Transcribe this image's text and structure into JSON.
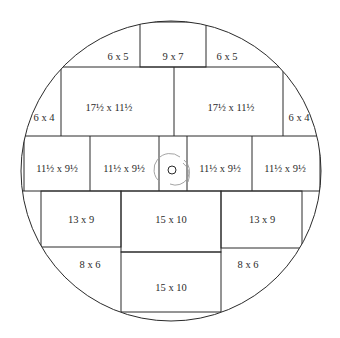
{
  "diagram": {
    "title": "",
    "pieces": [
      {
        "id": "top-left-6x5",
        "label": "6 x 5"
      },
      {
        "id": "top-center-9x7",
        "label": "9 x 7"
      },
      {
        "id": "top-right-6x5",
        "label": "6 x 5"
      },
      {
        "id": "left-6x4",
        "label": "6 x 4"
      },
      {
        "id": "upper-left-17x11",
        "label": "17½ x  11½"
      },
      {
        "id": "upper-right-17x11",
        "label": "17½ x 11½"
      },
      {
        "id": "right-6x4",
        "label": "6 x 4"
      },
      {
        "id": "middle-1-11x9",
        "label": "11½ x 9½"
      },
      {
        "id": "middle-2-11x9",
        "label": "11½ x 9½"
      },
      {
        "id": "middle-3-11x9",
        "label": "11½ x 9½"
      },
      {
        "id": "middle-4-11x9",
        "label": "11½ x 9½"
      },
      {
        "id": "lower-left-13x9",
        "label": "13 x 9"
      },
      {
        "id": "lower-center-15x10",
        "label": "15 x 10"
      },
      {
        "id": "lower-right-13x9",
        "label": "13 x 9"
      },
      {
        "id": "bottom-left-8x6",
        "label": "8 x 6"
      },
      {
        "id": "bottom-center-15x10",
        "label": "15 x 10"
      },
      {
        "id": "bottom-right-8x6",
        "label": "8 x 6"
      }
    ],
    "center_marker": "rotation-center"
  }
}
